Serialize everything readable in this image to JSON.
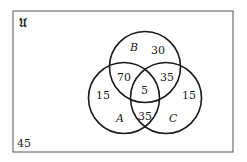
{
  "diagram": {
    "type": "venn",
    "universe_label": "Ʋ",
    "universe_symbol": "U (Fraktur)",
    "sets": [
      {
        "name": "A"
      },
      {
        "name": "B"
      },
      {
        "name": "C"
      }
    ],
    "regions": {
      "only_A": "15",
      "only_B": "30",
      "only_C": "15",
      "A_and_B_only": "70",
      "B_and_C_only": "35",
      "A_and_C_only": "35",
      "A_and_B_and_C": "5",
      "outside": "45"
    },
    "colors": {
      "stroke": "#1a1a1a",
      "background": "#ffffff"
    }
  }
}
